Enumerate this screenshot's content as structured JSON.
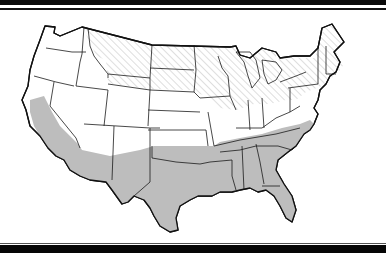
{
  "map": {
    "subject": "Contiguous United States",
    "legend_visible": false,
    "regions": [
      {
        "name": "northern-band",
        "pattern": "diagonal-hatch",
        "color": "#c8c8c8",
        "states": [
          "Washington (east)",
          "Oregon (east)",
          "Idaho",
          "Montana",
          "Wyoming",
          "North Dakota",
          "South Dakota",
          "Minnesota",
          "Wisconsin",
          "Michigan",
          "Iowa (north)",
          "Illinois (north)",
          "Indiana (north)",
          "Ohio (north)",
          "Pennsylvania",
          "New York",
          "Vermont",
          "New Hampshire",
          "Maine",
          "Massachusetts",
          "Connecticut",
          "Rhode Island",
          "New Jersey (north)"
        ]
      },
      {
        "name": "middle-band",
        "pattern": "none",
        "color": "#ffffff",
        "states": [
          "Washington (west)",
          "Oregon (west)",
          "Nevada",
          "Utah",
          "Colorado",
          "Nebraska",
          "Kansas",
          "Missouri",
          "Kentucky",
          "West Virginia",
          "Virginia",
          "Maryland",
          "Delaware",
          "Arizona (north)",
          "New Mexico (north)"
        ]
      },
      {
        "name": "southern-band",
        "pattern": "solid",
        "color": "#bdbdbd",
        "states": [
          "California",
          "Arizona (south)",
          "New Mexico (south)",
          "Texas",
          "Oklahoma",
          "Arkansas",
          "Louisiana",
          "Mississippi",
          "Alabama",
          "Tennessee",
          "Georgia",
          "Florida",
          "South Carolina",
          "North Carolina"
        ]
      }
    ]
  },
  "colors": {
    "frame": "#0a0a0a",
    "outline": "#1a1a1a",
    "gray_fill": "#bdbdbd",
    "hatch": "#c8c8c8",
    "background": "#ffffff"
  }
}
